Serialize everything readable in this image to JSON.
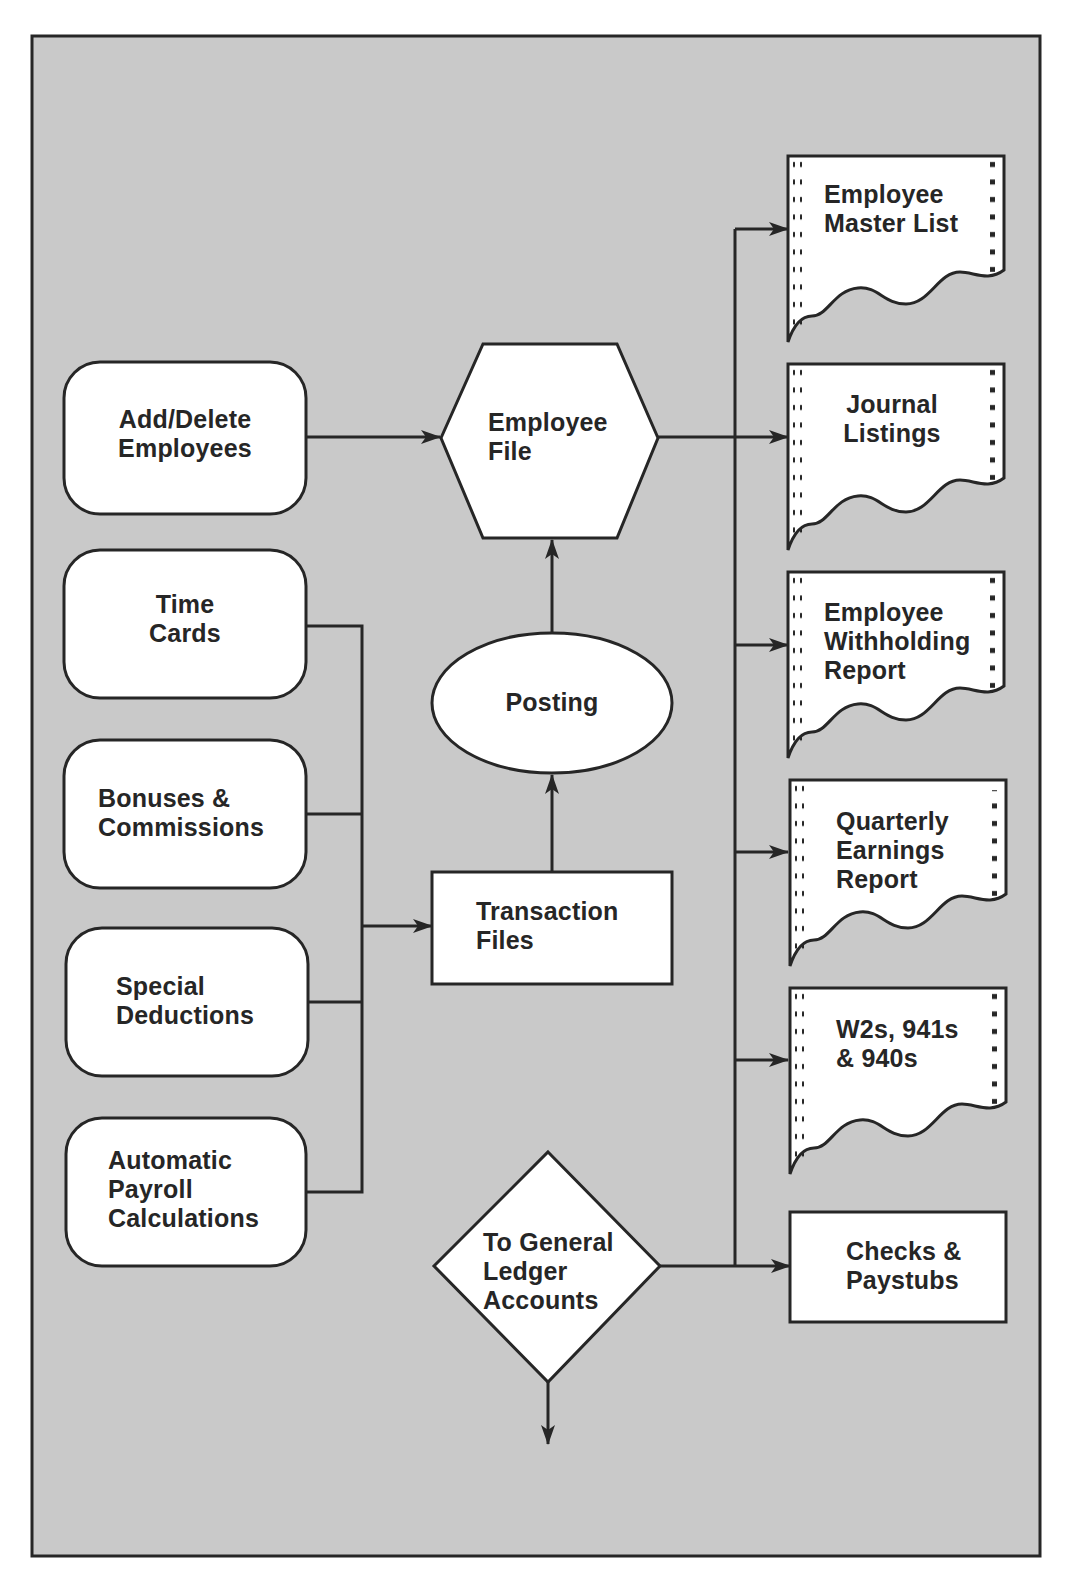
{
  "diagram": {
    "colors": {
      "background": "#c9c9c9",
      "shape_fill": "#ffffff",
      "stroke": "#262626",
      "text": "#262626",
      "page": "#ffffff"
    },
    "inputs": [
      {
        "id": "add-delete-employees",
        "label": "Add/Delete\nEmployees",
        "shape": "rounded-rectangle"
      },
      {
        "id": "time-cards",
        "label": "Time\nCards",
        "shape": "rounded-rectangle"
      },
      {
        "id": "bonuses-commissions",
        "label": "Bonuses &\nCommissions",
        "shape": "rounded-rectangle"
      },
      {
        "id": "special-deductions",
        "label": "Special\nDeductions",
        "shape": "rounded-rectangle"
      },
      {
        "id": "automatic-payroll-calculations",
        "label": "Automatic\nPayroll\nCalculations",
        "shape": "rounded-rectangle"
      }
    ],
    "process": {
      "employee_file": {
        "label": "Employee\nFile",
        "shape": "hexagon"
      },
      "posting": {
        "label": "Posting",
        "shape": "ellipse"
      },
      "transaction_files": {
        "label": "Transaction\nFiles",
        "shape": "rectangle"
      },
      "general_ledger": {
        "label": "To General\nLedger\nAccounts",
        "shape": "diamond"
      }
    },
    "outputs": [
      {
        "id": "employee-master-list",
        "label": "Employee\nMaster List",
        "shape": "printout"
      },
      {
        "id": "journal-listings",
        "label": "Journal\nListings",
        "shape": "printout"
      },
      {
        "id": "employee-withholding-report",
        "label": "Employee\nWithholding\nReport",
        "shape": "printout"
      },
      {
        "id": "quarterly-earnings-report",
        "label": "Quarterly\nEarnings\nReport",
        "shape": "printout"
      },
      {
        "id": "w2s-941s-940s",
        "label": "W2s, 941s\n& 940s",
        "shape": "printout"
      },
      {
        "id": "checks-paystubs",
        "label": "Checks &\nPaystubs",
        "shape": "rectangle"
      }
    ],
    "connections": [
      {
        "from": "add-delete-employees",
        "to": "employee-file"
      },
      {
        "from": "time-cards",
        "to": "transaction-files"
      },
      {
        "from": "bonuses-commissions",
        "to": "transaction-files"
      },
      {
        "from": "special-deductions",
        "to": "transaction-files"
      },
      {
        "from": "automatic-payroll-calculations",
        "to": "transaction-files"
      },
      {
        "from": "transaction-files",
        "to": "posting"
      },
      {
        "from": "posting",
        "to": "employee-file"
      },
      {
        "from": "employee-file",
        "to": "employee-master-list"
      },
      {
        "from": "employee-file",
        "to": "journal-listings"
      },
      {
        "from": "employee-file",
        "to": "employee-withholding-report"
      },
      {
        "from": "employee-file",
        "to": "quarterly-earnings-report"
      },
      {
        "from": "employee-file",
        "to": "w2s-941s-940s"
      },
      {
        "from": "general-ledger",
        "to": "checks-paystubs"
      },
      {
        "from": "general-ledger",
        "to": "off-page"
      }
    ]
  }
}
